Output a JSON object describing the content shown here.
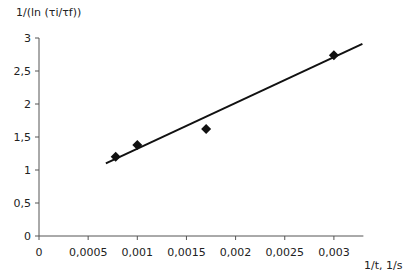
{
  "chart_data": {
    "type": "scatter",
    "title": "",
    "ylabel": "1/(ln (τi/τf))",
    "xlabel": "1/t, 1/s",
    "xlim": [
      0,
      0.0033
    ],
    "ylim": [
      0,
      3
    ],
    "grid": false,
    "legend": "none",
    "x_ticks": [
      0,
      0.0005,
      0.001,
      0.0015,
      0.002,
      0.0025,
      0.003
    ],
    "x_tick_labels": [
      "0",
      "0,0005",
      "0,001",
      "0,0015",
      "0,002",
      "0,0025",
      "0,003"
    ],
    "y_ticks": [
      0,
      0.5,
      1,
      1.5,
      2,
      2.5,
      3
    ],
    "y_tick_labels": [
      "0",
      "0,5",
      "1",
      "1,5",
      "2",
      "2,5",
      "3"
    ],
    "series": [
      {
        "name": "measured",
        "marker": "diamond",
        "color": "#111111",
        "points": [
          {
            "x": 0.00078,
            "y": 1.2
          },
          {
            "x": 0.001,
            "y": 1.38
          },
          {
            "x": 0.0017,
            "y": 1.62
          },
          {
            "x": 0.003,
            "y": 2.74
          }
        ]
      },
      {
        "name": "linear fit",
        "type": "line",
        "color": "#111111",
        "points": [
          {
            "x": 0.00068,
            "y": 1.1
          },
          {
            "x": 0.00329,
            "y": 2.91
          }
        ]
      }
    ]
  }
}
